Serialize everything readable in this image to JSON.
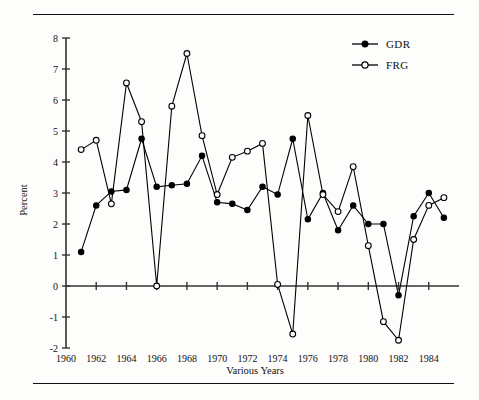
{
  "figure": {
    "ylabel": "Percent",
    "xlabel": "Various Years",
    "top_rule": "horizontal-rule",
    "bottom_rule": "horizontal-rule"
  },
  "legend": {
    "position": "top-right",
    "entries": [
      {
        "label": "GDR",
        "marker": "filled-circle",
        "color": "#000000"
      },
      {
        "label": "FRG",
        "marker": "open-circle",
        "color": "#000000"
      }
    ]
  },
  "axes": {
    "y_ticks": [
      "8",
      "7",
      "6",
      "5",
      "4",
      "3",
      "2",
      "1",
      "0",
      "-1",
      "-2"
    ],
    "x_ticks": [
      "1960",
      "1962",
      "1964",
      "1966",
      "1968",
      "1970",
      "1972",
      "1974",
      "1976",
      "1978",
      "1980",
      "1982",
      "1984"
    ]
  },
  "chart_data": {
    "type": "line",
    "title": "",
    "xlabel": "Various Years",
    "ylabel": "Percent",
    "xlim": [
      1960,
      1986
    ],
    "ylim": [
      -2,
      8
    ],
    "grid": false,
    "legend_position": "top-right",
    "x": [
      1961,
      1962,
      1963,
      1964,
      1965,
      1966,
      1967,
      1968,
      1969,
      1970,
      1971,
      1972,
      1973,
      1974,
      1975,
      1976,
      1977,
      1978,
      1979,
      1980,
      1981,
      1982,
      1983,
      1984,
      1985
    ],
    "series": [
      {
        "name": "GDR",
        "marker": "filled-circle",
        "color": "#000000",
        "values": [
          1.1,
          2.6,
          3.05,
          3.1,
          4.75,
          3.2,
          3.25,
          3.3,
          4.2,
          2.7,
          2.65,
          2.45,
          3.2,
          2.95,
          4.75,
          2.15,
          3.0,
          1.8,
          2.6,
          2.0,
          2.0,
          -0.3,
          2.25,
          3.0,
          2.2
        ]
      },
      {
        "name": "FRG",
        "marker": "open-circle",
        "color": "#000000",
        "values": [
          4.4,
          4.7,
          2.65,
          6.55,
          5.3,
          0.0,
          5.8,
          7.5,
          4.85,
          2.95,
          4.15,
          4.35,
          4.6,
          0.05,
          -1.55,
          5.5,
          2.95,
          2.4,
          3.85,
          1.3,
          -1.15,
          -1.75,
          1.5,
          2.6,
          2.85
        ]
      }
    ]
  }
}
